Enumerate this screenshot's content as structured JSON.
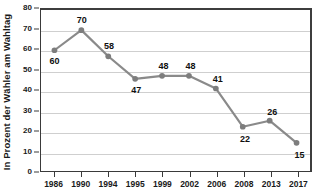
{
  "chart_data": {
    "type": "line",
    "title": "",
    "subtitle": "",
    "xlabel": "",
    "ylabel": "In Prozent der Wähler am Wahltag",
    "categories": [
      "1986",
      "1990",
      "1994",
      "1995",
      "1999",
      "2002",
      "2006",
      "2008",
      "2013",
      "2017"
    ],
    "values": [
      60,
      70,
      58,
      47,
      48,
      48,
      41,
      22,
      26,
      15
    ],
    "plotted_values": [
      60,
      70,
      57,
      45.8,
      47.3,
      47.3,
      41,
      22,
      25,
      14
    ],
    "data_labels": [
      "60",
      "70",
      "58",
      "47",
      "48",
      "48",
      "41",
      "22",
      "26",
      "15"
    ],
    "label_positions": [
      "below",
      "above",
      "above",
      "below",
      "above",
      "above",
      "above",
      "below",
      "above",
      "below"
    ],
    "ylim": [
      0,
      80
    ],
    "ytick_values": [
      0,
      10,
      20,
      30,
      40,
      50,
      60,
      70,
      80
    ],
    "ytick_labels": [
      "0",
      "10",
      "20",
      "30",
      "40",
      "50",
      "60",
      "70",
      "80"
    ],
    "grid": true,
    "legend": false,
    "legend_position": "none",
    "series": [
      {
        "name": "Wahlbeteiligung",
        "values": [
          60,
          70,
          58,
          47,
          48,
          48,
          41,
          22,
          26,
          15
        ]
      }
    ]
  },
  "colors": {
    "line": "#8a8a8a",
    "marker": "#7d7d7d",
    "gridline": "#cfcfcf",
    "axis": "#3a3a3a",
    "border_strong": "#3d3d3d",
    "text": "#101010",
    "background": "#ffffff"
  }
}
